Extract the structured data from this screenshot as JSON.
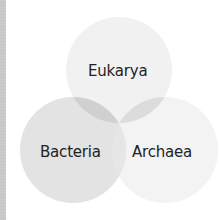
{
  "diagram": {
    "type": "venn",
    "sets": [
      {
        "id": "eukarya",
        "label": "Eukarya",
        "cx": 119,
        "cy": 70,
        "r": 53,
        "fill": "#f1f1f1"
      },
      {
        "id": "bacteria",
        "label": "Bacteria",
        "cx": 73,
        "cy": 150,
        "r": 53,
        "fill": "#e3e3e3"
      },
      {
        "id": "archaea",
        "label": "Archaea",
        "cx": 165,
        "cy": 150,
        "r": 53,
        "fill": "#f3f3f3"
      }
    ],
    "overlap_colors": {
      "eukarya_bacteria": "#cfcfcf",
      "eukarya_archaea": "#dcdcdc",
      "bacteria_archaea": "#e9e9e9"
    },
    "left_strip_color": "#c8c8c8"
  },
  "labels": {
    "eukarya": "Eukarya",
    "bacteria": "Bacteria",
    "archaea": "Archaea"
  }
}
